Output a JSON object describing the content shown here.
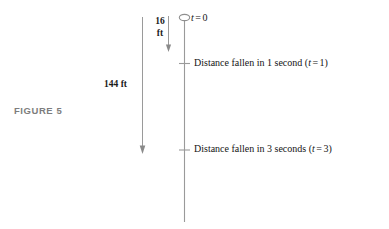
{
  "figure": {
    "caption": "FIGURE 5",
    "caption_color": "#7d7d7d",
    "ink_color": "#141414",
    "line_color": "#9a9a9a",
    "background": "#ffffff"
  },
  "dimensions": {
    "short_drop": {
      "value": "16",
      "unit": "ft",
      "arrow": "down"
    },
    "long_drop": {
      "value": "144",
      "unit": "ft",
      "label": "144 ft",
      "arrow": "down"
    }
  },
  "axis": {
    "name": "falling-body-timeline",
    "orientation": "vertical",
    "ball_icon": "ball-ellipse-icon"
  },
  "markers": [
    {
      "id": "t0",
      "text_prefix": "",
      "var": "t",
      "equals": "=",
      "value": "0",
      "full_text": "t = 0",
      "has_tick": false,
      "has_ball": true
    },
    {
      "id": "t1",
      "text_prefix": "Distance fallen in 1 second (",
      "var": "t",
      "equals": "=",
      "value": "1",
      "text_suffix": ")",
      "full_text": "Distance fallen in 1 second (t = 1)",
      "has_tick": true,
      "has_ball": false
    },
    {
      "id": "t3",
      "text_prefix": "Distance fallen in 3 seconds (",
      "var": "t",
      "equals": "=",
      "value": "3",
      "text_suffix": ")",
      "full_text": "Distance fallen in 3 seconds (t = 3)",
      "has_tick": true,
      "has_ball": false
    }
  ]
}
